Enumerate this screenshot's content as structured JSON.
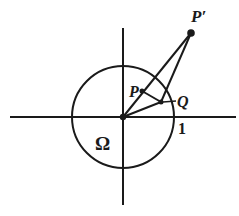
{
  "diagram": {
    "title": "",
    "colors": {
      "ink": "#1a1a1a",
      "background": "#ffffff"
    },
    "axes": {
      "origin": [
        123,
        117
      ],
      "x_axis": {
        "x1": 10,
        "x2": 236
      },
      "y_axis": {
        "y1": 28,
        "y2": 205
      }
    },
    "unit_circle": {
      "center": [
        123,
        117
      ],
      "radius": 51
    },
    "points": {
      "O": [
        123,
        117
      ],
      "P": [
        142,
        91
      ],
      "Q": [
        161,
        102
      ],
      "P_prime": [
        191,
        33
      ]
    },
    "labels": {
      "P_prime": "P′",
      "P": "P",
      "Q": "Q",
      "one": "1",
      "omega": "Ω"
    },
    "segments": [
      {
        "from": "O",
        "to": "P_prime"
      },
      {
        "from": "O",
        "to": "Q"
      },
      {
        "from": "P",
        "to": "Q"
      },
      {
        "from": "Q",
        "to": "P_prime"
      }
    ]
  }
}
